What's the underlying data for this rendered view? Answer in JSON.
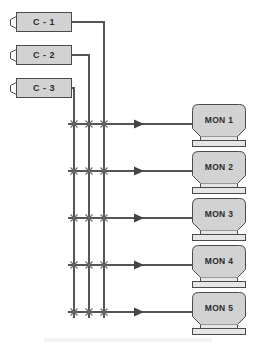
{
  "diagram": {
    "type": "matrix-switch-block-diagram",
    "colors": {
      "node_fill": "#d2d2d2",
      "node_stroke": "#4a4a4a",
      "wire": "#555555",
      "text": "#2b2b2b",
      "background": "#ffffff"
    },
    "cameras": [
      {
        "id": "c1",
        "label": "C - 1",
        "icon": "camera-icon",
        "x": 16,
        "y": 12,
        "bus": "bus-3"
      },
      {
        "id": "c2",
        "label": "C - 2",
        "icon": "camera-icon",
        "x": 16,
        "y": 45,
        "bus": "bus-2"
      },
      {
        "id": "c3",
        "label": "C - 3",
        "icon": "camera-icon",
        "x": 16,
        "y": 78,
        "bus": "bus-1"
      }
    ],
    "buses": [
      {
        "id": "bus-1",
        "label": "C - 3",
        "x": 74
      },
      {
        "id": "bus-2",
        "label": "C - 2",
        "x": 89
      },
      {
        "id": "bus-3",
        "label": "C - 1",
        "x": 104
      }
    ],
    "monitors": [
      {
        "id": "mon1",
        "label": "MON 1",
        "icon": "monitor-icon",
        "x": 192,
        "y": 104,
        "row_y": 124
      },
      {
        "id": "mon2",
        "label": "MON 2",
        "icon": "monitor-icon",
        "x": 192,
        "y": 151,
        "row_y": 171
      },
      {
        "id": "mon3",
        "label": "MON 3",
        "icon": "monitor-icon",
        "x": 192,
        "y": 198,
        "row_y": 218
      },
      {
        "id": "mon4",
        "label": "MON 4",
        "icon": "monitor-icon",
        "x": 192,
        "y": 245,
        "row_y": 265
      },
      {
        "id": "mon5",
        "label": "MON 5",
        "icon": "monitor-icon",
        "x": 192,
        "y": 292,
        "row_y": 312
      }
    ],
    "crosspoints": [
      {
        "bus": "bus-1",
        "row": "mon1",
        "x": 74,
        "y": 124,
        "marker": "x-marker"
      },
      {
        "bus": "bus-2",
        "row": "mon1",
        "x": 89,
        "y": 124,
        "marker": "x-marker"
      },
      {
        "bus": "bus-3",
        "row": "mon1",
        "x": 104,
        "y": 124,
        "marker": "x-marker"
      },
      {
        "bus": "bus-1",
        "row": "mon2",
        "x": 74,
        "y": 171,
        "marker": "x-marker"
      },
      {
        "bus": "bus-2",
        "row": "mon2",
        "x": 89,
        "y": 171,
        "marker": "x-marker"
      },
      {
        "bus": "bus-3",
        "row": "mon2",
        "x": 104,
        "y": 171,
        "marker": "x-marker"
      },
      {
        "bus": "bus-1",
        "row": "mon3",
        "x": 74,
        "y": 218,
        "marker": "x-marker"
      },
      {
        "bus": "bus-2",
        "row": "mon3",
        "x": 89,
        "y": 218,
        "marker": "x-marker"
      },
      {
        "bus": "bus-3",
        "row": "mon3",
        "x": 104,
        "y": 218,
        "marker": "x-marker"
      },
      {
        "bus": "bus-1",
        "row": "mon4",
        "x": 74,
        "y": 265,
        "marker": "x-marker"
      },
      {
        "bus": "bus-2",
        "row": "mon4",
        "x": 89,
        "y": 265,
        "marker": "x-marker"
      },
      {
        "bus": "bus-3",
        "row": "mon4",
        "x": 104,
        "y": 265,
        "marker": "x-marker"
      },
      {
        "bus": "bus-1",
        "row": "mon5",
        "x": 74,
        "y": 312,
        "marker": "x-marker"
      },
      {
        "bus": "bus-2",
        "row": "mon5",
        "x": 89,
        "y": 312,
        "marker": "x-marker"
      },
      {
        "bus": "bus-3",
        "row": "mon5",
        "x": 104,
        "y": 312,
        "marker": "x-marker"
      }
    ],
    "arrows": [
      {
        "row": "mon1",
        "x": 140,
        "y": 124,
        "direction": "right"
      },
      {
        "row": "mon2",
        "x": 140,
        "y": 171,
        "direction": "right"
      },
      {
        "row": "mon3",
        "x": 140,
        "y": 218,
        "direction": "right"
      },
      {
        "row": "mon4",
        "x": 140,
        "y": 265,
        "direction": "right"
      },
      {
        "row": "mon5",
        "x": 140,
        "y": 312,
        "direction": "right"
      }
    ]
  }
}
